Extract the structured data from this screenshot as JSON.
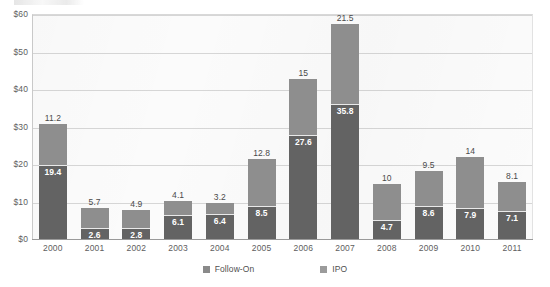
{
  "chart_data": {
    "type": "bar",
    "subtype": "stacked-column",
    "title": "",
    "xlabel": "",
    "ylabel": "",
    "ylim": [
      0,
      60
    ],
    "ytick_values": [
      0,
      10,
      20,
      30,
      40,
      50,
      60
    ],
    "ytick_labels": [
      "$0",
      "$10",
      "$20",
      "$30",
      "$40",
      "$50",
      "$60"
    ],
    "grid": true,
    "grid_axis": "y",
    "legend_position": "bottom",
    "categories": [
      "2000",
      "2001",
      "2002",
      "2003",
      "2004",
      "2005",
      "2006",
      "2007",
      "2008",
      "2009",
      "2010",
      "2011"
    ],
    "series": [
      {
        "name": "IPO",
        "color": "#636363",
        "stack_position": "bottom",
        "values": [
          19.4,
          2.6,
          2.8,
          6.1,
          6.4,
          8.5,
          27.6,
          35.8,
          4.7,
          8.6,
          7.9,
          7.1
        ],
        "labels": [
          "19.4",
          "2.6",
          "2.8",
          "6.1",
          "6.4",
          "8.5",
          "27.6",
          "35.8",
          "4.7",
          "8.6",
          "7.9",
          "7.1"
        ]
      },
      {
        "name": "Follow-On",
        "color": "#8e8e8e",
        "stack_position": "top",
        "values": [
          11.2,
          5.7,
          4.9,
          4.1,
          3.2,
          12.8,
          15,
          21.5,
          10,
          9.5,
          14,
          8.1
        ],
        "labels": [
          "11.2",
          "5.7",
          "4.9",
          "4.1",
          "3.2",
          "12.8",
          "15",
          "21.5",
          "10",
          "9.5",
          "14",
          "8.1"
        ]
      }
    ],
    "totals": [
      30.6,
      8.3,
      7.7,
      10.2,
      9.6,
      21.3,
      42.6,
      57.3,
      14.7,
      18.1,
      21.9,
      15.2
    ]
  },
  "legend": {
    "items": [
      {
        "label": "Follow-On",
        "swatch": "follow-on-swatch"
      },
      {
        "label": "IPO",
        "swatch": "ipo-swatch"
      }
    ]
  },
  "colors": {
    "ipo": "#636363",
    "follow_on": "#8e8e8e",
    "gridline": "#d6d6d6",
    "axis": "#9a9a9a",
    "plot_background": "#fbfbfb",
    "tick_text": "#5e5e5e",
    "value_label_text": "#4a4a4a",
    "inner_label_text": "#ffffff"
  }
}
